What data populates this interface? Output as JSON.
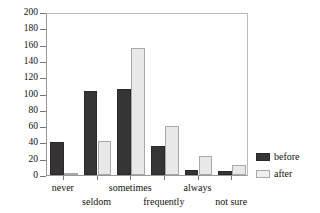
{
  "chart_data": {
    "type": "bar",
    "title": "",
    "subtitle": "",
    "xlabel": "",
    "ylabel": "Number of people",
    "categories": [
      "never",
      "seldom",
      "sometimes",
      "frequently",
      "always",
      "not sure"
    ],
    "series": [
      {
        "name": "before",
        "color": "#363434",
        "values": [
          40,
          103,
          105,
          35,
          6,
          5
        ]
      },
      {
        "name": "after",
        "color": "#e8e8e8",
        "values": [
          2,
          42,
          156,
          60,
          23,
          12
        ]
      }
    ],
    "ylim": [
      0,
      200
    ],
    "ytick_values": [
      0,
      20,
      40,
      60,
      80,
      100,
      120,
      140,
      160,
      180,
      200
    ],
    "ytick_labels": [
      "0",
      "20",
      "40",
      "60",
      "80",
      "100",
      "120",
      "140",
      "160",
      "180",
      "200"
    ],
    "grid": false,
    "legend_position": "right",
    "legend": [
      {
        "label": "before",
        "swatch": "dark-filled-square"
      },
      {
        "label": "after",
        "swatch": "light-outlined-square"
      }
    ],
    "xlabel_row_pattern": [
      0,
      1,
      0,
      1,
      0,
      1
    ]
  }
}
